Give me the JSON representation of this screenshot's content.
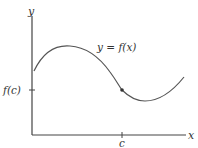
{
  "diagram": {
    "axes": {
      "y_label": "y",
      "x_label": "x"
    },
    "curve": {
      "label": "y = f(x)",
      "color": "#555555"
    },
    "point": {
      "x_label": "c",
      "y_label": "f(c)",
      "color": "#333333"
    }
  }
}
